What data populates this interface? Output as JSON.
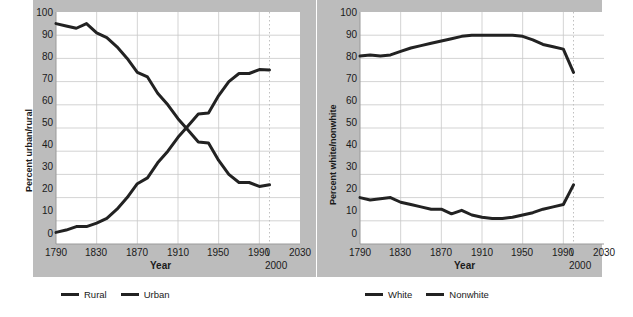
{
  "figure": {
    "background_color": "#bcbcbc",
    "plot_background_color": "#ffffff",
    "line_color": "#222222",
    "grid_color": "#c8c8c8",
    "text_color": "#1a1a1a"
  },
  "panels": [
    {
      "id": "urban-rural",
      "ylabel": "Percent urban/rural",
      "xlabel": "Year",
      "callout": {
        "slash": "\\",
        "year": "2000"
      },
      "legend": [
        {
          "label": "Rural",
          "color": "#222222"
        },
        {
          "label": "Urban",
          "color": "#222222"
        }
      ],
      "chart_data": {
        "type": "line",
        "title": "",
        "xlabel": "Year",
        "ylabel": "Percent urban/rural",
        "xlim": [
          1790,
          2030
        ],
        "ylim": [
          0,
          100
        ],
        "xticks": [
          1790,
          1830,
          1870,
          1910,
          1950,
          1990,
          2030
        ],
        "yticks": [
          0,
          10,
          20,
          30,
          40,
          50,
          60,
          70,
          80,
          90,
          100
        ],
        "grid": true,
        "legend_position": "below",
        "annotations": [
          {
            "text": "2000",
            "x": 2000,
            "note": "dotted vertical reference line at year 2000, data ends here"
          }
        ],
        "x": [
          1790,
          1800,
          1810,
          1820,
          1830,
          1840,
          1850,
          1860,
          1870,
          1880,
          1890,
          1900,
          1910,
          1920,
          1930,
          1940,
          1950,
          1960,
          1970,
          1980,
          1990,
          2000
        ],
        "series": [
          {
            "name": "Rural",
            "values": [
              95,
              94,
              93,
              95,
              91,
              89,
              85,
              80,
              74,
              72,
              65,
              60,
              54,
              49,
              44,
              43.5,
              36,
              30,
              26.5,
              26.5,
              24.8,
              25.5
            ]
          },
          {
            "name": "Urban",
            "values": [
              5,
              6,
              7.5,
              7.5,
              9,
              11,
              15,
              20,
              26,
              28.5,
              35,
              40,
              46,
              51,
              56,
              56.5,
              64,
              70,
              73.5,
              73.5,
              75.2,
              75
            ]
          }
        ]
      }
    },
    {
      "id": "white-nonwhite",
      "ylabel": "Percent white/nonwhite",
      "xlabel": "Year",
      "callout": {
        "slash": "\\",
        "year": "2000"
      },
      "legend": [
        {
          "label": "White",
          "color": "#222222"
        },
        {
          "label": "Nonwhite",
          "color": "#222222"
        }
      ],
      "chart_data": {
        "type": "line",
        "title": "",
        "xlabel": "Year",
        "ylabel": "Percent white/nonwhite",
        "xlim": [
          1790,
          2030
        ],
        "ylim": [
          0,
          100
        ],
        "xticks": [
          1790,
          1830,
          1870,
          1910,
          1950,
          1990,
          2030
        ],
        "yticks": [
          0,
          10,
          20,
          30,
          40,
          50,
          60,
          70,
          80,
          90,
          100
        ],
        "grid": true,
        "legend_position": "below",
        "annotations": [
          {
            "text": "2000",
            "x": 2000,
            "note": "dotted vertical reference line at year 2000, data ends here"
          }
        ],
        "x": [
          1790,
          1800,
          1810,
          1820,
          1830,
          1840,
          1850,
          1860,
          1870,
          1880,
          1890,
          1900,
          1910,
          1920,
          1930,
          1940,
          1950,
          1960,
          1970,
          1980,
          1990,
          2000
        ],
        "series": [
          {
            "name": "White",
            "values": [
              81,
              81.5,
              81,
              81.5,
              83,
              84.5,
              85.5,
              86.5,
              87.5,
              88.5,
              89.5,
              90,
              90,
              90,
              90,
              90,
              89.5,
              88,
              86,
              85,
              84,
              74
            ]
          },
          {
            "name": "Nonwhite",
            "values": [
              20,
              19,
              19.5,
              20,
              18,
              17,
              16,
              15,
              15,
              13,
              14.5,
              12.5,
              11.5,
              11,
              11,
              11.5,
              12.5,
              13.5,
              15,
              16,
              17,
              25.5
            ]
          }
        ]
      }
    }
  ]
}
